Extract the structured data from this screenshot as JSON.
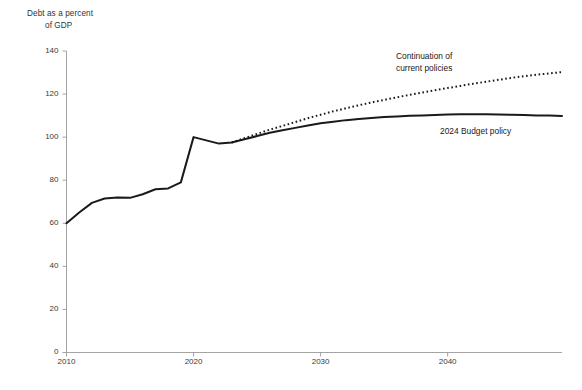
{
  "chart_data": {
    "type": "line",
    "title": "",
    "ylabel": "Debt as a percent of GDP",
    "ylabel_line1": "Debt as a percent",
    "ylabel_line2": "of GDP",
    "xlabel": "",
    "xlim": [
      2010,
      2049
    ],
    "ylim": [
      0,
      140
    ],
    "yticks": [
      0,
      20,
      40,
      60,
      80,
      100,
      120,
      140
    ],
    "xticks": [
      2010,
      2020,
      2030,
      2040
    ],
    "ytick_labels": [
      "0",
      "20",
      "40",
      "60",
      "80",
      "100",
      "120",
      "140"
    ],
    "xtick_labels": [
      "2010",
      "2020",
      "2030",
      "2040"
    ],
    "grid": false,
    "legend_position": "inline-annotations",
    "annotations": [
      {
        "id": "continuation",
        "text_line1": "Continuation of",
        "text_line2": "current policies",
        "text": "Continuation of current policies"
      },
      {
        "id": "budget",
        "text": "2024 Budget policy"
      }
    ],
    "series": [
      {
        "name": "2024 Budget policy",
        "style": "solid",
        "color": "#1a1a1a",
        "x": [
          2010,
          2011,
          2012,
          2013,
          2014,
          2015,
          2016,
          2017,
          2018,
          2019,
          2020,
          2021,
          2022,
          2023,
          2024,
          2025,
          2026,
          2027,
          2028,
          2029,
          2030,
          2031,
          2032,
          2033,
          2034,
          2035,
          2036,
          2037,
          2038,
          2039,
          2040,
          2041,
          2042,
          2043,
          2044,
          2045,
          2046,
          2047,
          2048,
          2049
        ],
        "values": [
          60.0,
          65.0,
          69.5,
          71.5,
          72.0,
          71.8,
          73.5,
          75.8,
          76.2,
          79.0,
          100.0,
          98.5,
          97.0,
          97.5,
          99.0,
          100.5,
          102.0,
          103.2,
          104.3,
          105.4,
          106.4,
          107.2,
          107.9,
          108.4,
          108.9,
          109.3,
          109.6,
          109.9,
          110.1,
          110.3,
          110.5,
          110.6,
          110.6,
          110.6,
          110.5,
          110.4,
          110.3,
          110.1,
          110.0,
          109.8
        ]
      },
      {
        "name": "Continuation of current policies",
        "style": "dotted",
        "color": "#1a1a1a",
        "x": [
          2023,
          2024,
          2025,
          2026,
          2027,
          2028,
          2029,
          2030,
          2031,
          2032,
          2033,
          2034,
          2035,
          2036,
          2037,
          2038,
          2039,
          2040,
          2041,
          2042,
          2043,
          2044,
          2045,
          2046,
          2047,
          2048,
          2049
        ],
        "values": [
          97.5,
          99.5,
          101.5,
          103.5,
          105.2,
          107.0,
          108.8,
          110.4,
          112.0,
          113.4,
          114.8,
          116.1,
          117.3,
          118.5,
          119.6,
          120.7,
          121.8,
          122.8,
          123.8,
          124.8,
          125.7,
          126.6,
          127.5,
          128.3,
          129.0,
          129.6,
          130.2
        ]
      }
    ]
  }
}
